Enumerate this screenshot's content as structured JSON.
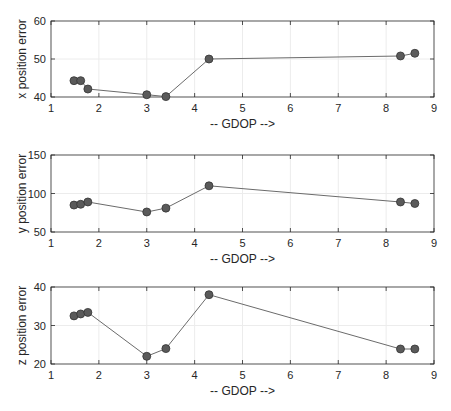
{
  "chart_data": [
    {
      "type": "line",
      "title": "",
      "xlabel": "-- GDOP -->",
      "ylabel": "x position error",
      "xlim": [
        1,
        9
      ],
      "ylim": [
        40,
        60
      ],
      "xticks": [
        1,
        2,
        3,
        4,
        5,
        6,
        7,
        8,
        9
      ],
      "yticks": [
        40,
        50,
        60
      ],
      "grid": true,
      "x": [
        1.48,
        1.62,
        1.77,
        3.0,
        3.4,
        4.3,
        8.3,
        8.6
      ],
      "values": [
        44.3,
        44.3,
        42.1,
        40.6,
        40.1,
        50.0,
        50.8,
        51.5
      ]
    },
    {
      "type": "line",
      "title": "",
      "xlabel": "-- GDOP -->",
      "ylabel": "y position error",
      "xlim": [
        1,
        9
      ],
      "ylim": [
        50,
        150
      ],
      "xticks": [
        1,
        2,
        3,
        4,
        5,
        6,
        7,
        8,
        9
      ],
      "yticks": [
        50,
        100,
        150
      ],
      "grid": true,
      "x": [
        1.48,
        1.62,
        1.77,
        3.0,
        3.4,
        4.3,
        8.3,
        8.6
      ],
      "values": [
        85,
        86,
        89,
        76,
        81,
        110,
        89,
        87
      ]
    },
    {
      "type": "line",
      "title": "",
      "xlabel": "-- GDOP -->",
      "ylabel": "z position error",
      "xlim": [
        1,
        9
      ],
      "ylim": [
        20,
        40
      ],
      "xticks": [
        1,
        2,
        3,
        4,
        5,
        6,
        7,
        8,
        9
      ],
      "yticks": [
        20,
        30,
        40
      ],
      "grid": true,
      "x": [
        1.48,
        1.62,
        1.77,
        3.0,
        3.4,
        4.3,
        8.3,
        8.6
      ],
      "values": [
        32.5,
        33.0,
        33.4,
        22.0,
        24.0,
        38.0,
        23.9,
        23.9
      ]
    }
  ],
  "style": {
    "line_color": "#6b6b6b",
    "marker_fill": "#5a5a5a",
    "marker_edge": "#333333",
    "axis_color": "#262626",
    "grid_color": "#ececec"
  }
}
